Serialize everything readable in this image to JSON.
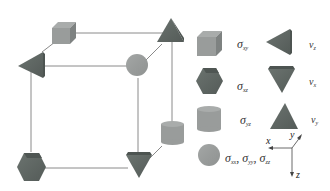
{
  "diagram": {
    "title": "",
    "colors": {
      "light_gray": "#9a9d9c",
      "dark_gray": "#5e6663",
      "edge": "#555555",
      "line": "#8a8a8a"
    },
    "cube_nodes": [
      {
        "shape": "cube",
        "position": "back-top-left",
        "represents": "sigma_xy"
      },
      {
        "shape": "triangle-up",
        "position": "back-top-right",
        "represents": "v_y"
      },
      {
        "shape": "triangle-left",
        "position": "front-top-left",
        "represents": "v_z"
      },
      {
        "shape": "circle",
        "position": "front-top-right",
        "represents": "sigma_xx, sigma_yy, sigma_zz"
      },
      {
        "shape": "cylinder",
        "position": "back-bottom-right",
        "represents": "sigma_yz"
      },
      {
        "shape": "hexagon",
        "position": "front-bottom-left",
        "represents": "sigma_xz"
      },
      {
        "shape": "triangle-down",
        "position": "front-bottom-right",
        "represents": "v_x"
      }
    ],
    "legend": [
      {
        "shape": "cube",
        "symbol": "σ",
        "sub": "xy"
      },
      {
        "shape": "hexagon",
        "symbol": "σ",
        "sub": "xz"
      },
      {
        "shape": "cylinder",
        "symbol": "σ",
        "sub": "yz"
      },
      {
        "shape": "circle",
        "symbol": "σ",
        "sub": "xx",
        "extra": [
          {
            "symbol": "σ",
            "sub": "yy"
          },
          {
            "symbol": "σ",
            "sub": "zz"
          }
        ]
      },
      {
        "shape": "triangle-left",
        "symbol": "v",
        "sub": "z"
      },
      {
        "shape": "triangle-down",
        "symbol": "v",
        "sub": "x"
      },
      {
        "shape": "triangle-up",
        "symbol": "v",
        "sub": "y"
      }
    ],
    "axes": {
      "x": "x",
      "y": "y",
      "z": "z"
    },
    "separator": ","
  }
}
